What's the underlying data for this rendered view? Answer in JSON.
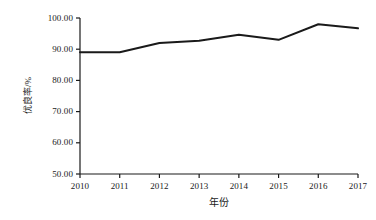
{
  "chart_data": {
    "type": "line",
    "title": "",
    "xlabel": "年份",
    "ylabel": "优良率/%",
    "categories": [
      "2010",
      "2011",
      "2012",
      "2013",
      "2014",
      "2015",
      "2016",
      "2017"
    ],
    "x": [
      2010,
      2011,
      2012,
      2013,
      2014,
      2015,
      2016,
      2017
    ],
    "values": [
      89.0,
      89.0,
      92.0,
      92.7,
      94.6,
      93.0,
      98.0,
      96.7
    ],
    "series": [
      {
        "name": "优良率",
        "values": [
          89.0,
          89.0,
          92.0,
          92.7,
          94.6,
          93.0,
          98.0,
          96.7
        ],
        "color": "#1a1a1a",
        "line_width": 2,
        "markers": "none"
      }
    ],
    "ylim": [
      50.0,
      100.0
    ],
    "xlim": [
      2010,
      2017
    ],
    "y_ticks": [
      50.0,
      60.0,
      70.0,
      80.0,
      90.0,
      100.0
    ],
    "y_tick_labels": [
      "50.00",
      "60.00",
      "70.00",
      "80.00",
      "90.00",
      "100.00"
    ],
    "x_ticks": [
      2010,
      2011,
      2012,
      2013,
      2014,
      2015,
      2016,
      2017
    ],
    "x_tick_labels": [
      "2010",
      "2011",
      "2012",
      "2013",
      "2014",
      "2015",
      "2016",
      "2017"
    ],
    "grid": false,
    "legend": false,
    "legend_position": "none",
    "spines": [
      "left",
      "bottom"
    ],
    "background_color": "#ffffff",
    "axis_color": "#1a1a1a"
  }
}
